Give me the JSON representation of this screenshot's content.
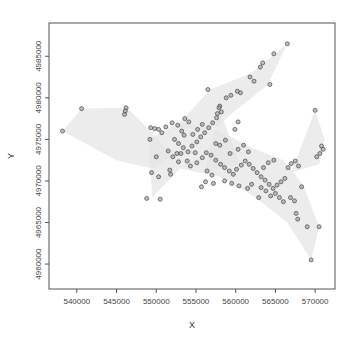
{
  "chart_data": {
    "type": "scatter",
    "title": "",
    "xlabel": "X",
    "ylabel": "Y",
    "xlim": [
      536500,
      572500
    ],
    "ylim": [
      4957000,
      4989000
    ],
    "x_ticks": [
      540000,
      545000,
      550000,
      555000,
      560000,
      565000,
      570000
    ],
    "x_tick_labels": [
      "540000",
      "545000",
      "550000",
      "555000",
      "560000",
      "565000",
      "570000"
    ],
    "y_ticks": [
      4960000,
      4965000,
      4970000,
      4975000,
      4980000,
      4985000
    ],
    "y_tick_labels": [
      "4960000",
      "4965000",
      "4970000",
      "4975000",
      "4980000",
      "4985000"
    ],
    "grid": false,
    "legend": null,
    "colors": {
      "point_stroke": "#555555",
      "point_fill": "#9a9a9a",
      "hull_fill": "#e6e6e6",
      "frame": "#555555"
    },
    "hulls": [
      [
        [
          538200,
          4976000
        ],
        [
          540600,
          4978700
        ],
        [
          546300,
          4978800
        ],
        [
          549500,
          4975800
        ],
        [
          552000,
          4973000
        ],
        [
          549500,
          4971500
        ],
        [
          545000,
          4972500
        ],
        [
          538200,
          4976000
        ]
      ],
      [
        [
          552500,
          4976500
        ],
        [
          556800,
          4981000
        ],
        [
          562000,
          4983000
        ],
        [
          566500,
          4986500
        ],
        [
          564000,
          4981500
        ],
        [
          560000,
          4978500
        ],
        [
          557000,
          4976000
        ],
        [
          552500,
          4976500
        ]
      ],
      [
        [
          549000,
          4975000
        ],
        [
          553000,
          4977000
        ],
        [
          558000,
          4976000
        ],
        [
          562000,
          4974000
        ],
        [
          566000,
          4972500
        ],
        [
          568500,
          4969500
        ],
        [
          570500,
          4964500
        ],
        [
          569500,
          4960500
        ],
        [
          566500,
          4965000
        ],
        [
          562500,
          4968000
        ],
        [
          558000,
          4970500
        ],
        [
          553000,
          4971500
        ],
        [
          549500,
          4968000
        ],
        [
          549000,
          4975000
        ]
      ],
      [
        [
          567000,
          4971000
        ],
        [
          570000,
          4978500
        ],
        [
          571200,
          4975000
        ],
        [
          570500,
          4972000
        ],
        [
          567000,
          4971000
        ]
      ],
      [
        [
          556000,
          4971000
        ],
        [
          558000,
          4978500
        ],
        [
          560500,
          4972000
        ],
        [
          556000,
          4971000
        ]
      ]
    ],
    "points": [
      [
        538200,
        4976000
      ],
      [
        540600,
        4978700
      ],
      [
        546200,
        4978800
      ],
      [
        546100,
        4978400
      ],
      [
        546000,
        4978000
      ],
      [
        549300,
        4976400
      ],
      [
        549800,
        4976300
      ],
      [
        550300,
        4976200
      ],
      [
        550700,
        4975800
      ],
      [
        550000,
        4972900
      ],
      [
        549400,
        4971000
      ],
      [
        550300,
        4970500
      ],
      [
        548800,
        4967900
      ],
      [
        550500,
        4967800
      ],
      [
        549200,
        4975000
      ],
      [
        551200,
        4976500
      ],
      [
        552000,
        4977000
      ],
      [
        552700,
        4976700
      ],
      [
        553200,
        4976000
      ],
      [
        553500,
        4975500
      ],
      [
        552300,
        4975000
      ],
      [
        552800,
        4974500
      ],
      [
        553400,
        4974000
      ],
      [
        554000,
        4973500
      ],
      [
        554500,
        4974200
      ],
      [
        555100,
        4974700
      ],
      [
        555600,
        4975300
      ],
      [
        556100,
        4975800
      ],
      [
        556600,
        4976400
      ],
      [
        557100,
        4977000
      ],
      [
        557600,
        4977600
      ],
      [
        558200,
        4978300
      ],
      [
        558000,
        4979000
      ],
      [
        558800,
        4980000
      ],
      [
        559400,
        4980300
      ],
      [
        560200,
        4980800
      ],
      [
        560600,
        4980600
      ],
      [
        561800,
        4982500
      ],
      [
        562300,
        4982000
      ],
      [
        563100,
        4983700
      ],
      [
        563400,
        4984200
      ],
      [
        564800,
        4985300
      ],
      [
        566500,
        4986500
      ],
      [
        564300,
        4981600
      ],
      [
        556500,
        4981000
      ],
      [
        557900,
        4978800
      ],
      [
        557700,
        4978100
      ],
      [
        554600,
        4975600
      ],
      [
        555200,
        4976200
      ],
      [
        555800,
        4976800
      ],
      [
        553900,
        4972400
      ],
      [
        554300,
        4971800
      ],
      [
        555100,
        4972200
      ],
      [
        555800,
        4972800
      ],
      [
        556300,
        4973400
      ],
      [
        556900,
        4973100
      ],
      [
        557500,
        4972500
      ],
      [
        558100,
        4972000
      ],
      [
        558600,
        4971600
      ],
      [
        559200,
        4971200
      ],
      [
        559700,
        4970800
      ],
      [
        560100,
        4971400
      ],
      [
        560700,
        4971900
      ],
      [
        561200,
        4972400
      ],
      [
        561700,
        4972000
      ],
      [
        562200,
        4971500
      ],
      [
        562700,
        4971000
      ],
      [
        563200,
        4970500
      ],
      [
        563700,
        4970100
      ],
      [
        564200,
        4969600
      ],
      [
        564700,
        4969100
      ],
      [
        565200,
        4969500
      ],
      [
        565700,
        4969900
      ],
      [
        566200,
        4970300
      ],
      [
        565000,
        4968500
      ],
      [
        565500,
        4968000
      ],
      [
        566000,
        4967500
      ],
      [
        564400,
        4968200
      ],
      [
        563800,
        4968800
      ],
      [
        563200,
        4969200
      ],
      [
        566600,
        4971600
      ],
      [
        567000,
        4972100
      ],
      [
        567500,
        4972400
      ],
      [
        567900,
        4971800
      ],
      [
        568300,
        4969300
      ],
      [
        567600,
        4966100
      ],
      [
        567800,
        4965400
      ],
      [
        569000,
        4964500
      ],
      [
        570500,
        4964500
      ],
      [
        569500,
        4960500
      ],
      [
        566900,
        4968000
      ],
      [
        567400,
        4967600
      ],
      [
        570000,
        4978500
      ],
      [
        570800,
        4974200
      ],
      [
        571000,
        4973800
      ],
      [
        570600,
        4973300
      ],
      [
        570200,
        4972900
      ],
      [
        553600,
        4977500
      ],
      [
        554100,
        4977100
      ],
      [
        552600,
        4973300
      ],
      [
        551500,
        4973600
      ],
      [
        552100,
        4972900
      ],
      [
        555700,
        4969300
      ],
      [
        556200,
        4969900
      ],
      [
        557200,
        4969700
      ],
      [
        558600,
        4970000
      ],
      [
        559500,
        4969700
      ],
      [
        560400,
        4969400
      ],
      [
        561500,
        4969100
      ],
      [
        562900,
        4968000
      ],
      [
        556400,
        4971200
      ],
      [
        557000,
        4970700
      ],
      [
        560300,
        4973800
      ],
      [
        561000,
        4974300
      ],
      [
        561600,
        4973500
      ],
      [
        559300,
        4973300
      ],
      [
        558000,
        4974300
      ],
      [
        558700,
        4974900
      ],
      [
        554900,
        4973400
      ],
      [
        553100,
        4973300
      ],
      [
        552800,
        4972300
      ],
      [
        551700,
        4971300
      ],
      [
        551800,
        4970800
      ],
      [
        562000,
        4969600
      ],
      [
        563500,
        4971600
      ],
      [
        564100,
        4972200
      ],
      [
        564800,
        4972500
      ],
      [
        557500,
        4974500
      ],
      [
        559900,
        4976200
      ],
      [
        560300,
        4977100
      ]
    ]
  }
}
